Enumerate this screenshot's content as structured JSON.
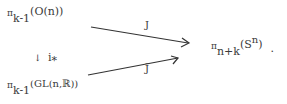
{
  "diagram": {
    "top_left": {
      "symbol": "π",
      "subscript": "k-1",
      "argument": "(O(n))"
    },
    "bottom_left": {
      "symbol": "π",
      "subscript": "k-1",
      "argument": "(GL(n,ℝ))"
    },
    "vertical_map": {
      "arrow": "↓",
      "label": "i",
      "label_sub": "*"
    },
    "target": {
      "symbol": "π",
      "subscript": "n+k",
      "argument_open": "(S",
      "argument_sup": "n",
      "argument_close": ")",
      "trailing": "."
    },
    "top_arrow_label": "J",
    "bottom_arrow_label": "J̃"
  }
}
